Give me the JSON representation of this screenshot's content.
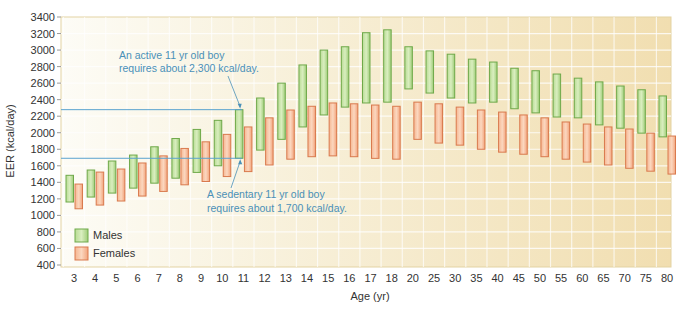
{
  "chart_data": {
    "type": "bar",
    "subtype": "floating-range",
    "title": "",
    "xlabel": "Age (yr)",
    "ylabel": "EER (kcal/day)",
    "ylim": [
      400,
      3400
    ],
    "yticks": [
      400,
      600,
      800,
      1000,
      1200,
      1400,
      1600,
      1800,
      2000,
      2200,
      2400,
      2600,
      2800,
      3000,
      3200,
      3400
    ],
    "grid": true,
    "legend_position": "lower-left",
    "categories": [
      "3",
      "4",
      "5",
      "6",
      "7",
      "8",
      "9",
      "10",
      "11",
      "12",
      "13",
      "14",
      "15",
      "16",
      "17",
      "18",
      "20",
      "25",
      "30",
      "35",
      "40",
      "45",
      "50",
      "55",
      "60",
      "65",
      "70",
      "75",
      "80"
    ],
    "series": [
      {
        "name": "Males",
        "color": "#8cc068",
        "low": [
          1162,
          1222,
          1270,
          1330,
          1390,
          1450,
          1520,
          1600,
          1691,
          1790,
          1920,
          2070,
          2215,
          2310,
          2360,
          2370,
          2530,
          2480,
          2420,
          2360,
          2370,
          2290,
          2240,
          2190,
          2180,
          2095,
          2055,
          1995,
          1950
        ],
        "high": [
          1485,
          1549,
          1658,
          1730,
          1830,
          1930,
          2040,
          2150,
          2279,
          2420,
          2600,
          2820,
          3000,
          3040,
          3210,
          3245,
          3040,
          2990,
          2950,
          2890,
          2855,
          2780,
          2750,
          2710,
          2660,
          2615,
          2565,
          2520,
          2445
        ]
      },
      {
        "name": "Females",
        "color": "#ee9a6e",
        "low": [
          1080,
          1125,
          1174,
          1234,
          1290,
          1370,
          1410,
          1470,
          1530,
          1610,
          1680,
          1710,
          1720,
          1710,
          1690,
          1680,
          1920,
          1875,
          1850,
          1800,
          1765,
          1740,
          1710,
          1680,
          1645,
          1610,
          1570,
          1535,
          1500
        ],
        "high": [
          1379,
          1524,
          1561,
          1634,
          1720,
          1810,
          1890,
          1980,
          2070,
          2180,
          2275,
          2320,
          2360,
          2350,
          2335,
          2320,
          2370,
          2350,
          2310,
          2275,
          2250,
          2215,
          2180,
          2130,
          2105,
          2070,
          2045,
          1995,
          1960
        ]
      }
    ],
    "annotations": [
      {
        "text": [
          "An active 11 yr old boy",
          "requires about 2,300 kcal/day."
        ],
        "value": 2279,
        "category": "11"
      },
      {
        "text": [
          "A sedentary 11 yr old boy",
          "requires about 1,700 kcal/day."
        ],
        "value": 1691,
        "category": "11"
      }
    ]
  },
  "legend": {
    "males": "Males",
    "females": "Females"
  },
  "axis": {
    "x_title": "Age (yr)",
    "y_title": "EER (kcal/day)"
  },
  "annotation_active": {
    "line1": "An active 11 yr old boy",
    "line2": "requires about 2,300 kcal/day."
  },
  "annotation_sedentary": {
    "line1": "A sedentary 11 yr old boy",
    "line2": "requires about 1,700 kcal/day."
  }
}
